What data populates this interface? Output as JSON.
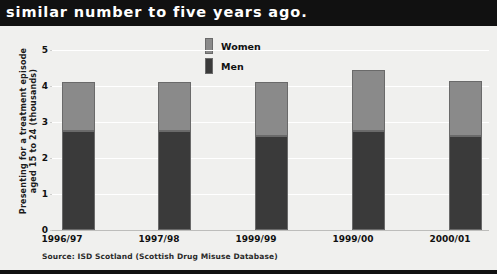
{
  "headline": "similar number to five years ago.",
  "source": "Source: ISD Scotland (Scottish Drug Misuse Database)",
  "legend": {
    "women_label": "Women",
    "men_label": "Men"
  },
  "colors": {
    "women": "#8a8a8a",
    "men": "#3a3a3a",
    "band": "#111111",
    "plot_background": "#f0f0ee",
    "gridline": "#ffffff"
  },
  "chart_data": {
    "type": "bar",
    "stacked": true,
    "title": "similar number to five years ago.",
    "xlabel": "",
    "ylabel": "Presenting for a treatment episode aged 15 to 24 (thousands)",
    "categories": [
      "1996/97",
      "1997/98",
      "1999/99",
      "1999/00",
      "2000/01"
    ],
    "yticks": [
      "0",
      "1",
      "2",
      "3",
      "4",
      "5"
    ],
    "ylim": [
      0,
      5
    ],
    "grid": true,
    "legend_position": "top-center",
    "series": [
      {
        "name": "Men",
        "values": [
          2.75,
          2.75,
          2.6,
          2.75,
          2.6
        ]
      },
      {
        "name": "Women",
        "values": [
          1.35,
          1.35,
          1.5,
          1.7,
          1.55
        ]
      }
    ],
    "totals": [
      4.1,
      4.1,
      4.1,
      4.45,
      4.15
    ],
    "annotations": [
      "Source: ISD Scotland (Scottish Drug Misuse Database)"
    ]
  }
}
